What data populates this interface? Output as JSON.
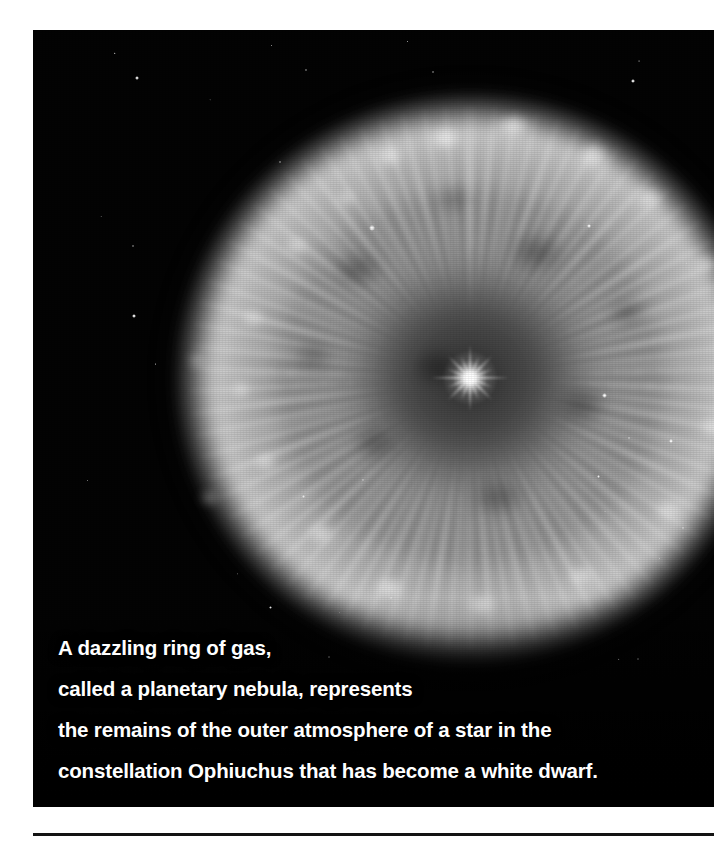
{
  "page": {
    "background_color": "#ffffff",
    "rule_color": "#131313"
  },
  "photo": {
    "alt_name": "planetary-nebula-photograph",
    "background_color": "#030303",
    "subject": "planetary nebula",
    "features": {
      "ring_label": "ring of gas",
      "central_star_label": "white dwarf",
      "filaments_label": "radial filaments"
    }
  },
  "caption": {
    "text_color": "#ffffff",
    "lines": [
      "A dazzling ring of gas,",
      "called a planetary nebula, represents",
      "the remains of the outer atmosphere of a star in the",
      "constellation Ophiuchus that has become a white dwarf."
    ],
    "full_text": "A dazzling ring of gas, called a planetary nebula, represents the remains of the outer atmosphere of a star in the constellation Ophiuchus that has become a white dwarf."
  },
  "stars": [
    {
      "x": 104,
      "y": 48,
      "size": 3.2,
      "name": "star-1"
    },
    {
      "x": 273,
      "y": 40,
      "size": 2.6,
      "name": "star-2"
    },
    {
      "x": 400,
      "y": 42,
      "size": 2.8,
      "name": "star-3"
    },
    {
      "x": 600,
      "y": 51,
      "size": 3.6,
      "name": "star-4"
    },
    {
      "x": 100,
      "y": 216,
      "size": 2.6,
      "name": "star-5"
    },
    {
      "x": 247,
      "y": 132,
      "size": 2.4,
      "name": "star-6"
    },
    {
      "x": 339,
      "y": 198,
      "size": 5.4,
      "name": "star-7"
    },
    {
      "x": 556,
      "y": 196,
      "size": 3.6,
      "name": "star-8"
    },
    {
      "x": 684,
      "y": 196,
      "size": 3.4,
      "name": "star-9"
    },
    {
      "x": 101,
      "y": 286,
      "size": 3.6,
      "name": "star-10"
    },
    {
      "x": 571,
      "y": 365,
      "size": 5.0,
      "name": "star-11"
    },
    {
      "x": 565,
      "y": 446,
      "size": 3.0,
      "name": "star-12"
    },
    {
      "x": 638,
      "y": 411,
      "size": 3.2,
      "name": "star-13"
    },
    {
      "x": 596,
      "y": 408,
      "size": 2.8,
      "name": "star-14"
    },
    {
      "x": 270,
      "y": 466,
      "size": 3.0,
      "name": "star-15"
    },
    {
      "x": 330,
      "y": 450,
      "size": 2.6,
      "name": "star-16"
    },
    {
      "x": 650,
      "y": 498,
      "size": 2.8,
      "name": "star-17"
    },
    {
      "x": 237,
      "y": 577,
      "size": 3.0,
      "name": "star-18"
    },
    {
      "x": 358,
      "y": 568,
      "size": 2.4,
      "name": "star-19"
    },
    {
      "x": 605,
      "y": 629,
      "size": 2.6,
      "name": "star-20"
    },
    {
      "x": 296,
      "y": 627,
      "size": 2.4,
      "name": "star-21"
    },
    {
      "x": 430,
      "y": 708,
      "size": 2.4,
      "name": "star-22"
    }
  ]
}
